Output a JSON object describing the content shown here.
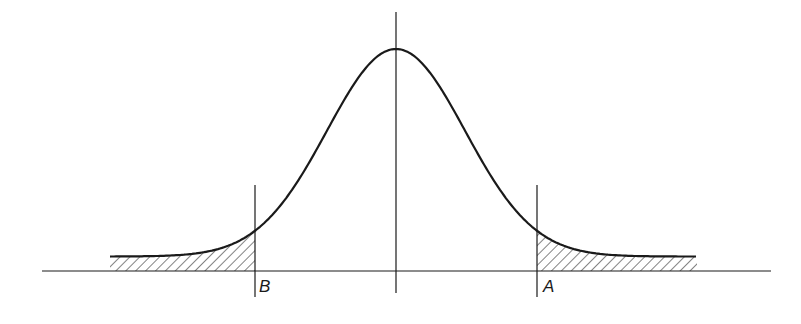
{
  "figure": {
    "colors": {
      "stroke": "#1a1a1a",
      "hatch": "#1a1a1a",
      "background": "#ffffff"
    },
    "labels": {
      "left_cut": "B",
      "right_cut": "A"
    },
    "shaded_regions": [
      {
        "name": "left-tail",
        "from": "left end",
        "to": "B",
        "pattern": "diagonal-hatch"
      },
      {
        "name": "right-tail",
        "from": "A",
        "to": "right end",
        "pattern": "diagonal-hatch"
      }
    ]
  }
}
